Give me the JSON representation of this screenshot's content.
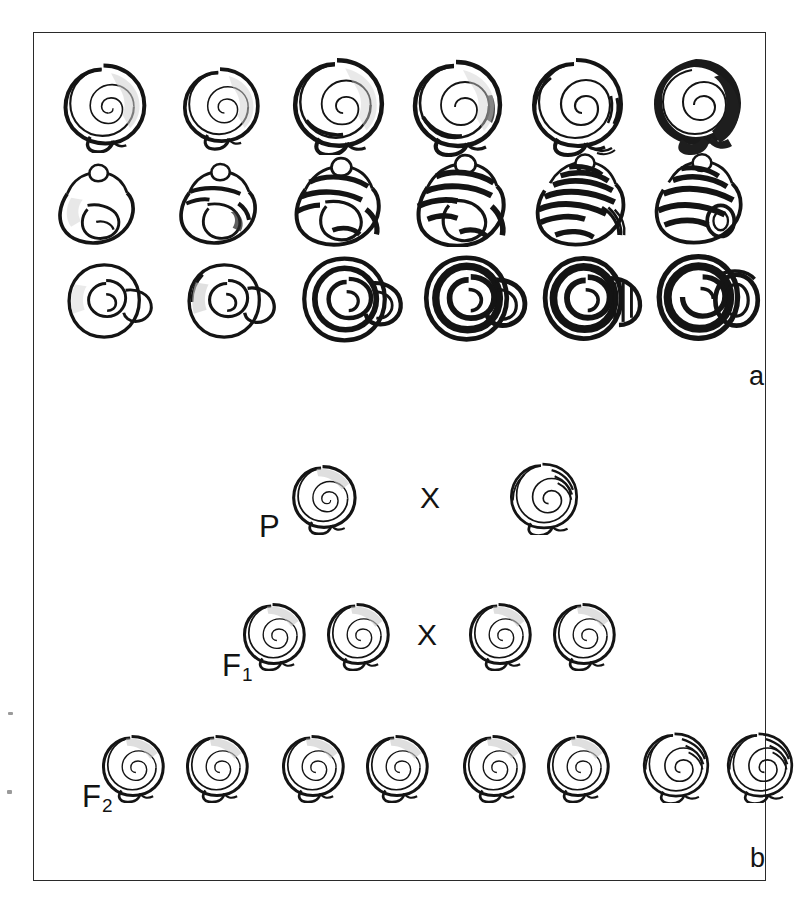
{
  "figure": {
    "panels": [
      {
        "id": "a",
        "letter": "a",
        "description": "Shell variation series: three rows of six shells each shown in apical, lateral and umbilical view with increasing band development"
      },
      {
        "id": "b",
        "letter": "b",
        "description": "Mendelian cross diagram of shell banding inheritance"
      }
    ],
    "panel_letters": {
      "a": "a",
      "b": "b"
    },
    "cross_symbol": "X"
  },
  "panel_a": {
    "letter": "a",
    "rows": [
      {
        "name": "apical-view-row",
        "view": "apical",
        "shells": [
          {
            "index": 1,
            "morph": "unbanded",
            "bands": 0,
            "shade": "light"
          },
          {
            "index": 2,
            "morph": "unbanded",
            "bands": 0,
            "shade": "light"
          },
          {
            "index": 3,
            "morph": "faintly-banded",
            "bands": 1,
            "shade": "light"
          },
          {
            "index": 4,
            "morph": "banded",
            "bands": 2,
            "shade": "medium"
          },
          {
            "index": 5,
            "morph": "multi-banded",
            "bands": 4,
            "shade": "medium"
          },
          {
            "index": 6,
            "morph": "melanic",
            "bands": 5,
            "shade": "dark"
          }
        ]
      },
      {
        "name": "lateral-view-row",
        "view": "lateral",
        "shells": [
          {
            "index": 1,
            "morph": "unbanded",
            "bands": 0,
            "shade": "light"
          },
          {
            "index": 2,
            "morph": "faintly-banded",
            "bands": 2,
            "shade": "light"
          },
          {
            "index": 3,
            "morph": "banded",
            "bands": 3,
            "shade": "medium"
          },
          {
            "index": 4,
            "morph": "banded",
            "bands": 4,
            "shade": "medium"
          },
          {
            "index": 5,
            "morph": "multi-banded",
            "bands": 6,
            "shade": "dark"
          },
          {
            "index": 6,
            "morph": "melanic",
            "bands": 6,
            "shade": "dark"
          }
        ]
      },
      {
        "name": "umbilical-view-row",
        "view": "umbilical",
        "shells": [
          {
            "index": 1,
            "morph": "unbanded",
            "bands": 0,
            "shade": "light"
          },
          {
            "index": 2,
            "morph": "faintly-banded",
            "bands": 1,
            "shade": "light"
          },
          {
            "index": 3,
            "morph": "banded",
            "bands": 3,
            "shade": "medium"
          },
          {
            "index": 4,
            "morph": "banded",
            "bands": 4,
            "shade": "dark"
          },
          {
            "index": 5,
            "morph": "multi-banded",
            "bands": 5,
            "shade": "dark"
          },
          {
            "index": 6,
            "morph": "melanic",
            "bands": 5,
            "shade": "dark"
          }
        ]
      }
    ]
  },
  "panel_b": {
    "letter": "b",
    "generations": [
      {
        "id": "P",
        "label": "P",
        "label_base": "P",
        "label_sub": "",
        "cross": "X",
        "left_group": [
          {
            "morph": "unbanded",
            "bands": 0
          }
        ],
        "right_group": [
          {
            "morph": "banded",
            "bands": 4
          }
        ]
      },
      {
        "id": "F1",
        "label": "F1",
        "label_base": "F",
        "label_sub": "1",
        "cross": "X",
        "left_group": [
          {
            "morph": "unbanded",
            "bands": 0
          },
          {
            "morph": "unbanded",
            "bands": 0
          }
        ],
        "right_group": [
          {
            "morph": "unbanded",
            "bands": 0
          },
          {
            "morph": "unbanded",
            "bands": 0
          }
        ]
      },
      {
        "id": "F2",
        "label": "F2",
        "label_base": "F",
        "label_sub": "2",
        "cross": "",
        "offspring": [
          {
            "morph": "unbanded",
            "bands": 0
          },
          {
            "morph": "unbanded",
            "bands": 0
          },
          {
            "morph": "unbanded",
            "bands": 0
          },
          {
            "morph": "unbanded",
            "bands": 0
          },
          {
            "morph": "unbanded",
            "bands": 0
          },
          {
            "morph": "unbanded",
            "bands": 0
          },
          {
            "morph": "banded",
            "bands": 4
          },
          {
            "morph": "banded",
            "bands": 4
          }
        ],
        "ratio": "3:1"
      }
    ]
  },
  "colors": {
    "ink": "#131313",
    "frame": "#2a2a2a",
    "background": "#ffffff",
    "shade_light": "#d8d8d8",
    "shade_medium": "#8f8f8f",
    "shade_dark": "#2b2b2b"
  }
}
